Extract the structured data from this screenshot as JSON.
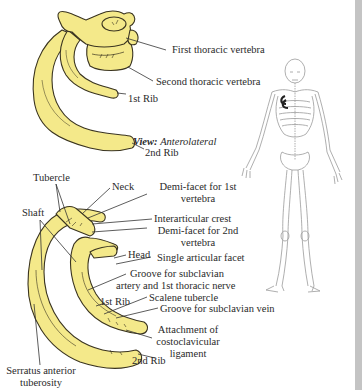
{
  "figure": {
    "view_label": "View:",
    "view_value": "Anterolateral",
    "colors": {
      "bone_fill": "#f4e98a",
      "bone_stroke": "#3a3420",
      "leader": "#333333",
      "text": "#2a2a2a",
      "skeleton": "#9a9a9a",
      "highlight": "#222222",
      "side_strip": "#c4c4c4"
    }
  },
  "upper_labels": {
    "first_thoracic_vertebra": "First thoracic vertebra",
    "second_thoracic_vertebra": "Second thoracic vertebra",
    "first_rib": "1st Rib",
    "second_rib": "2nd Rib"
  },
  "lower_labels": {
    "tubercle": "Tubercle",
    "neck": "Neck",
    "shaft": "Shaft",
    "demi_facet_1_line1": "Demi-facet for 1st",
    "demi_facet_1_line2": "vertebra",
    "interarticular_crest": "Interarticular crest",
    "demi_facet_2_line1": "Demi-facet for 2nd",
    "demi_facet_2_line2": "vertebra",
    "head": "Head",
    "single_articular_facet": "Single articular facet",
    "groove_artery_line1": "Groove for subclavian",
    "groove_artery_line2": "artery and 1st thoracic nerve",
    "first_rib": "1st Rib",
    "scalene_tubercle": "Scalene tubercle",
    "groove_vein": "Groove for subclavian vein",
    "attachment_line1": "Attachment of",
    "attachment_line2": "costoclavicular",
    "attachment_line3": "ligament",
    "second_rib": "2nd Rib",
    "serratus_line1": "Serratus anterior",
    "serratus_line2": "tuberosity"
  }
}
